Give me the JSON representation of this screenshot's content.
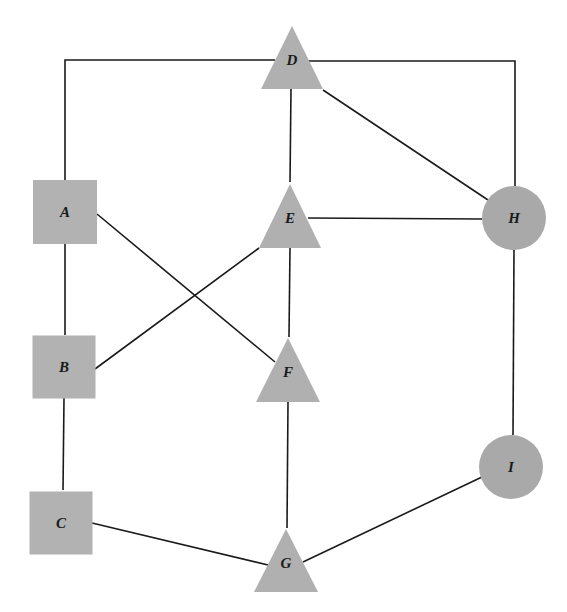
{
  "diagram": {
    "type": "graph",
    "width": 567,
    "height": 612,
    "colors": {
      "background": "#ffffff",
      "edge": "#1a1a1a",
      "square_fill": "#b2b2b2",
      "triangle_fill": "#b0b0b0",
      "circle_fill": "#a9a9a9",
      "label": "#1a1a1a"
    },
    "nodes": [
      {
        "id": "A",
        "label": "A",
        "shape": "square",
        "cx": 65,
        "cy": 212,
        "size": 64
      },
      {
        "id": "B",
        "label": "B",
        "shape": "square",
        "cx": 64,
        "cy": 367,
        "size": 63
      },
      {
        "id": "C",
        "label": "C",
        "shape": "square",
        "cx": 61,
        "cy": 523,
        "size": 63
      },
      {
        "id": "D",
        "label": "D",
        "shape": "triangle",
        "cx": 292,
        "cy": 60,
        "apex_y": 26,
        "base_y": 89,
        "half_base": 31
      },
      {
        "id": "E",
        "label": "E",
        "shape": "triangle",
        "cx": 290,
        "cy": 218,
        "apex_y": 184,
        "base_y": 248,
        "half_base": 31
      },
      {
        "id": "F",
        "label": "F",
        "shape": "triangle",
        "cx": 288,
        "cy": 372,
        "apex_y": 338,
        "base_y": 402,
        "half_base": 32
      },
      {
        "id": "G",
        "label": "G",
        "shape": "triangle",
        "cx": 286,
        "cy": 563,
        "apex_y": 529,
        "base_y": 592,
        "half_base": 32
      },
      {
        "id": "H",
        "label": "H",
        "shape": "circle",
        "cx": 514,
        "cy": 218,
        "r": 32
      },
      {
        "id": "I",
        "label": "I",
        "shape": "circle",
        "cx": 511,
        "cy": 467,
        "r": 32
      }
    ],
    "edges": [
      {
        "from": "A",
        "to": "D",
        "points": [
          [
            65,
            180
          ],
          [
            65,
            60
          ],
          [
            275,
            60
          ]
        ]
      },
      {
        "from": "D",
        "to": "H",
        "points": [
          [
            308,
            61
          ],
          [
            515,
            61
          ],
          [
            515,
            186
          ]
        ]
      },
      {
        "from": "D",
        "to": "E",
        "points": [
          [
            291,
            89
          ],
          [
            290,
            182
          ]
        ]
      },
      {
        "from": "D",
        "to": "H",
        "points": [
          [
            323,
            90
          ],
          [
            488,
            200
          ]
        ]
      },
      {
        "from": "E",
        "to": "H",
        "points": [
          [
            308,
            218
          ],
          [
            482,
            219
          ]
        ]
      },
      {
        "from": "A",
        "to": "B",
        "points": [
          [
            65,
            244
          ],
          [
            65,
            335
          ]
        ]
      },
      {
        "from": "A",
        "to": "F",
        "points": [
          [
            97,
            214
          ],
          [
            275,
            362
          ]
        ]
      },
      {
        "from": "B",
        "to": "E",
        "points": [
          [
            95,
            369
          ],
          [
            259,
            248
          ]
        ]
      },
      {
        "from": "E",
        "to": "F",
        "points": [
          [
            290,
            248
          ],
          [
            289,
            337
          ]
        ]
      },
      {
        "from": "B",
        "to": "C",
        "points": [
          [
            64,
            398
          ],
          [
            63,
            490
          ]
        ]
      },
      {
        "from": "F",
        "to": "G",
        "points": [
          [
            288,
            402
          ],
          [
            287,
            528
          ]
        ]
      },
      {
        "from": "C",
        "to": "G",
        "points": [
          [
            92,
            523
          ],
          [
            268,
            565
          ]
        ]
      },
      {
        "from": "H",
        "to": "I",
        "points": [
          [
            514,
            250
          ],
          [
            513,
            435
          ]
        ]
      },
      {
        "from": "G",
        "to": "I",
        "points": [
          [
            303,
            562
          ],
          [
            482,
            477
          ]
        ]
      }
    ]
  }
}
